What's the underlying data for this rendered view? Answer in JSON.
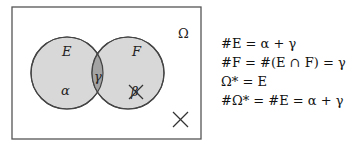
{
  "diagram": {
    "universe_label": "Ω",
    "set_e_label": "E",
    "set_f_label": "F",
    "region_e_only": "α",
    "region_intersection": "γ",
    "region_f_only": "β",
    "colors": {
      "circle_fill": "#d8d8d8",
      "intersection_fill": "#a3a3a3",
      "stroke": "#444444"
    }
  },
  "equations": [
    "#E = α + γ",
    "#F = #(E ∩ F) = γ",
    "Ω* = E",
    "#Ω* = #E = α + γ"
  ]
}
